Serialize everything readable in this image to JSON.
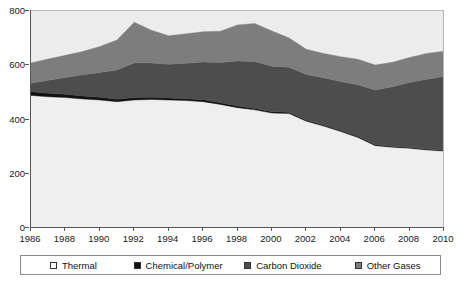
{
  "chart_data": {
    "type": "area",
    "title": "",
    "subtitle": "",
    "xlabel": "",
    "ylabel": "",
    "stacked": true,
    "grid": false,
    "legend_position": "bottom",
    "xlim": [
      1986,
      2010
    ],
    "ylim": [
      0,
      800
    ],
    "x": [
      1986,
      1987,
      1988,
      1989,
      1990,
      1991,
      1992,
      1993,
      1994,
      1995,
      1996,
      1997,
      1998,
      1999,
      2000,
      2001,
      2002,
      2003,
      2004,
      2005,
      2006,
      2007,
      2008,
      2009,
      2010
    ],
    "xtick_labels": [
      "1986",
      "1988",
      "1990",
      "1992",
      "1994",
      "1996",
      "1998",
      "2000",
      "2002",
      "2004",
      "2006",
      "2008",
      "2010"
    ],
    "xticks": [
      1986,
      1988,
      1990,
      1992,
      1994,
      1996,
      1998,
      2000,
      2002,
      2004,
      2006,
      2008,
      2010
    ],
    "ytick_labels": [
      "0",
      "200",
      "400",
      "600",
      "800"
    ],
    "yticks": [
      0,
      200,
      400,
      600,
      800
    ],
    "series": [
      {
        "name": "Thermal",
        "color": "#efefef",
        "values": [
          485,
          480,
          477,
          472,
          468,
          462,
          468,
          470,
          468,
          466,
          462,
          452,
          440,
          432,
          420,
          418,
          390,
          372,
          352,
          330,
          300,
          294,
          290,
          284,
          280
        ]
      },
      {
        "name": "Chemical/Polymer",
        "color": "#121212",
        "values": [
          14,
          13,
          12,
          11,
          10,
          9,
          9,
          8,
          8,
          7,
          7,
          6,
          6,
          5,
          5,
          5,
          4,
          4,
          4,
          4,
          3,
          3,
          3,
          3,
          3
        ]
      },
      {
        "name": "Carbon Dioxide",
        "color": "#4d4d4d",
        "values": [
          31,
          48,
          62,
          78,
          92,
          108,
          128,
          127,
          124,
          131,
          139,
          148,
          166,
          173,
          168,
          166,
          168,
          174,
          180,
          190,
          202,
          220,
          240,
          258,
          272
        ]
      },
      {
        "name": "Other Gases",
        "color": "#7d7d7d",
        "values": [
          75,
          78,
          82,
          86,
          95,
          110,
          150,
          120,
          105,
          108,
          112,
          116,
          133,
          140,
          130,
          108,
          93,
          90,
          92,
          94,
          92,
          90,
          92,
          95,
          93
        ]
      }
    ],
    "totals": [
      605,
      619,
      633,
      647,
      665,
      689,
      755,
      725,
      705,
      712,
      720,
      722,
      745,
      750,
      723,
      697,
      655,
      640,
      628,
      618,
      597,
      607,
      625,
      640,
      648
    ]
  },
  "legend": {
    "items": [
      {
        "label": "Thermal",
        "swatch_color": "#ffffff",
        "icon": "square-swatch-icon"
      },
      {
        "label": "Chemical/Polymer",
        "swatch_color": "#121212",
        "icon": "square-swatch-icon"
      },
      {
        "label": "Carbon Dioxide",
        "swatch_color": "#4d4d4d",
        "icon": "square-swatch-icon"
      },
      {
        "label": "Other Gases",
        "swatch_color": "#7d7d7d",
        "icon": "square-swatch-icon"
      }
    ]
  },
  "style": {
    "plot_background": "#ececec",
    "axis_color": "#555555",
    "text_color": "#1a1a1a",
    "page_background": "#ffffff"
  }
}
